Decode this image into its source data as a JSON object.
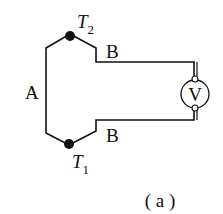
{
  "diagram": {
    "type": "thermocouple-circuit",
    "wire_a_label": "A",
    "wire_b_top_label": "B",
    "wire_b_bottom_label": "B",
    "junction_top": {
      "label": "T",
      "subscript": "2"
    },
    "junction_bottom": {
      "label": "T",
      "subscript": "1"
    },
    "meter_label": "V",
    "caption": "( a )",
    "colors": {
      "line": "#111111",
      "background": "#ffffff"
    }
  }
}
